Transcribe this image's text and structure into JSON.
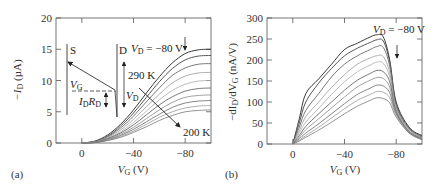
{
  "chart_data": [
    {
      "panel": "(a)",
      "type": "line",
      "title": "",
      "xlabel": "V_G (V)",
      "ylabel": "-I_D (µA)",
      "xlim": [
        20,
        -100
      ],
      "ylim": [
        0,
        20
      ],
      "xticks": [
        0,
        -40,
        -80
      ],
      "xtick_labels": [
        "0",
        "−40",
        "−80"
      ],
      "yticks": [
        0,
        5,
        10,
        15,
        20
      ],
      "ytick_labels": [
        "0",
        "5",
        "10",
        "15",
        "20"
      ],
      "grid": false,
      "annotations": [
        "V_D = −80 V",
        "290 K",
        "200 K",
        "S",
        "D",
        "V_G",
        "I_D R_D",
        "V_D"
      ],
      "series_note": "Transfer curves at temperatures from 290 K (top) to 200 K (bottom)",
      "x": [
        0,
        -10,
        -20,
        -30,
        -40,
        -50,
        -60,
        -70,
        -80,
        -90,
        -100
      ],
      "series": [
        {
          "name": "290 K",
          "values": [
            0,
            0.3,
            1.3,
            3.0,
            5.3,
            8.0,
            10.6,
            12.8,
            14.3,
            14.9,
            15.0
          ]
        },
        {
          "name": "280 K",
          "values": [
            0,
            0.25,
            1.1,
            2.7,
            4.8,
            7.3,
            9.8,
            11.9,
            13.3,
            13.9,
            14.0
          ]
        },
        {
          "name": "270 K",
          "values": [
            0,
            0.2,
            1.0,
            2.4,
            4.3,
            6.6,
            8.8,
            10.8,
            12.0,
            12.6,
            12.7
          ]
        },
        {
          "name": "260 K",
          "values": [
            0,
            0.18,
            0.9,
            2.1,
            3.8,
            5.8,
            7.8,
            9.6,
            10.7,
            11.2,
            11.3
          ]
        },
        {
          "name": "250 K",
          "values": [
            0,
            0.15,
            0.8,
            1.8,
            3.3,
            5.1,
            6.9,
            8.4,
            9.4,
            9.9,
            10.0
          ]
        },
        {
          "name": "240 K",
          "values": [
            0,
            0.12,
            0.7,
            1.6,
            2.9,
            4.5,
            6.1,
            7.4,
            8.3,
            8.7,
            8.8
          ]
        },
        {
          "name": "230 K",
          "values": [
            0,
            0.1,
            0.6,
            1.4,
            2.5,
            3.9,
            5.3,
            6.5,
            7.3,
            7.6,
            7.7
          ]
        },
        {
          "name": "220 K",
          "values": [
            0,
            0.08,
            0.5,
            1.2,
            2.2,
            3.4,
            4.6,
            5.7,
            6.4,
            6.7,
            6.8
          ]
        },
        {
          "name": "210 K",
          "values": [
            0,
            0.07,
            0.45,
            1.05,
            1.9,
            3.0,
            4.1,
            5.0,
            5.6,
            5.9,
            6.0
          ]
        },
        {
          "name": "200 K",
          "values": [
            0,
            0.06,
            0.4,
            0.9,
            1.7,
            2.6,
            3.6,
            4.4,
            5.0,
            5.2,
            5.3
          ]
        }
      ]
    },
    {
      "panel": "(b)",
      "type": "line",
      "title": "",
      "xlabel": "V_G (V)",
      "ylabel": "-dI_D/dV_G (nA/V)",
      "xlim": [
        20,
        -100
      ],
      "ylim": [
        0,
        300
      ],
      "xticks": [
        0,
        -40,
        -80
      ],
      "xtick_labels": [
        "0",
        "−40",
        "−80"
      ],
      "yticks": [
        0,
        50,
        100,
        150,
        200,
        250,
        300
      ],
      "ytick_labels": [
        "0",
        "50",
        "100",
        "150",
        "200",
        "250",
        "300"
      ],
      "grid": false,
      "annotations": [
        "V_D = −80 V"
      ],
      "x": [
        0,
        -5,
        -10,
        -20,
        -30,
        -40,
        -50,
        -60,
        -65,
        -70,
        -75,
        -80,
        -90,
        -100
      ],
      "series": [
        {
          "name": "290 K",
          "values": [
            0,
            60,
            120,
            155,
            190,
            225,
            240,
            255,
            260,
            255,
            200,
            100,
            40,
            20
          ]
        },
        {
          "name": "280 K",
          "values": [
            0,
            50,
            100,
            145,
            180,
            210,
            228,
            242,
            248,
            245,
            195,
            95,
            38,
            18
          ]
        },
        {
          "name": "270 K",
          "values": [
            0,
            40,
            80,
            120,
            160,
            190,
            210,
            225,
            232,
            230,
            185,
            90,
            36,
            16
          ]
        },
        {
          "name": "260 K",
          "values": [
            0,
            32,
            65,
            100,
            135,
            165,
            190,
            205,
            210,
            208,
            170,
            85,
            34,
            15
          ]
        },
        {
          "name": "250 K",
          "values": [
            0,
            26,
            52,
            85,
            118,
            148,
            172,
            188,
            195,
            192,
            160,
            82,
            32,
            14
          ]
        },
        {
          "name": "240 K",
          "values": [
            0,
            20,
            42,
            72,
            100,
            128,
            152,
            168,
            175,
            172,
            148,
            78,
            30,
            13
          ]
        },
        {
          "name": "230 K",
          "values": [
            0,
            16,
            34,
            60,
            86,
            112,
            136,
            152,
            158,
            156,
            135,
            75,
            29,
            12
          ]
        },
        {
          "name": "220 K",
          "values": [
            0,
            12,
            26,
            48,
            72,
            96,
            118,
            133,
            140,
            138,
            122,
            72,
            28,
            12
          ]
        },
        {
          "name": "210 K",
          "values": [
            0,
            9,
            20,
            40,
            62,
            84,
            104,
            118,
            125,
            123,
            110,
            68,
            27,
            11
          ]
        },
        {
          "name": "200 K",
          "values": [
            0,
            7,
            16,
            33,
            52,
            72,
            90,
            104,
            110,
            108,
            98,
            64,
            26,
            10
          ]
        }
      ]
    }
  ],
  "labels": {
    "panel_a": "(a)",
    "panel_b": "(b)",
    "a_ylabel": "−I",
    "a_ylabel_sub": "D",
    "a_ylabel_unit": " (µA)",
    "a_xlabel": "V",
    "a_xlabel_sub": "G",
    "a_xlabel_unit": " (V)",
    "b_ylabel": "−dI",
    "b_ylabel_sub": "D",
    "b_ylabel_mid": "/dV",
    "b_ylabel_sub2": "G",
    "b_ylabel_unit": " (nA/V)",
    "b_xlabel": "V",
    "b_xlabel_sub": "G",
    "b_xlabel_unit": " (V)",
    "vd_label": "V",
    "vd_sub": "D",
    "vd_value": " = −80 V",
    "temp_high": "290 K",
    "temp_low": "200 K",
    "inset_s": "S",
    "inset_d": "D",
    "inset_vg": "V",
    "inset_vg_sub": "G",
    "inset_idrd_i": "I",
    "inset_idrd_sub1": "D",
    "inset_idrd_r": "R",
    "inset_idrd_sub2": "D",
    "inset_vd": "V",
    "inset_vd_sub": "D"
  }
}
